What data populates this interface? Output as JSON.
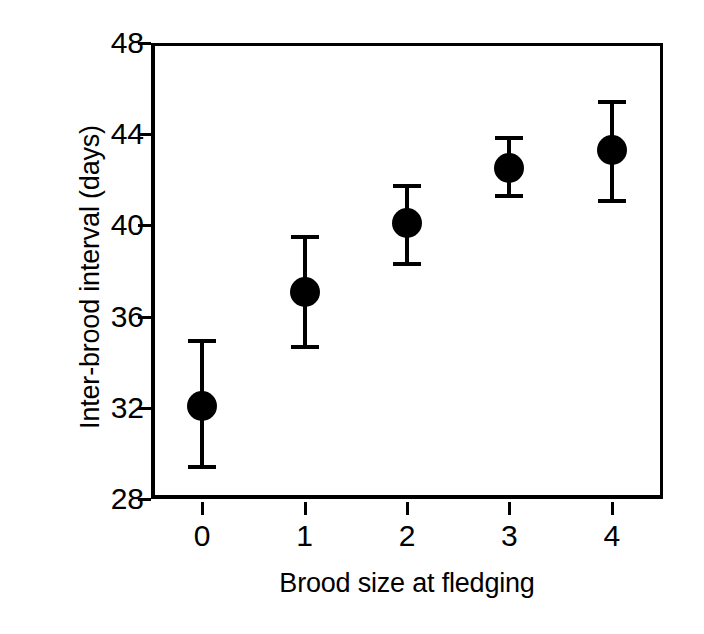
{
  "chart_data": {
    "type": "scatter",
    "title": "",
    "xlabel": "Brood size at fledging",
    "ylabel": "Inter-brood interval (days)",
    "xlim": [
      -0.5,
      4.5
    ],
    "ylim": [
      28,
      48
    ],
    "grid": false,
    "legend": false,
    "error_bar_style": "mean with capped error bars",
    "marker_style": "filled black circle",
    "xticks": [
      0,
      1,
      2,
      3,
      4
    ],
    "xtick_labels": [
      "0",
      "1",
      "2",
      "3",
      "4"
    ],
    "yticks": [
      28,
      32,
      36,
      40,
      44,
      48
    ],
    "ytick_labels": [
      "28",
      "32",
      "36",
      "40",
      "44",
      "48"
    ],
    "x": [
      0,
      1,
      2,
      3,
      4
    ],
    "values": [
      32.1,
      37.1,
      40.1,
      42.5,
      43.3
    ],
    "error_low": [
      29.3,
      34.6,
      38.2,
      41.2,
      41.0
    ],
    "error_high": [
      35.0,
      39.6,
      41.8,
      43.9,
      45.5
    ],
    "points": [
      {
        "x": "0",
        "y": 32.1,
        "low": 29.3,
        "high": 35.0
      },
      {
        "x": "1",
        "y": 37.1,
        "low": 34.6,
        "high": 39.6
      },
      {
        "x": "2",
        "y": 40.1,
        "low": 38.2,
        "high": 41.8
      },
      {
        "x": "3",
        "y": 42.5,
        "low": 41.2,
        "high": 43.9
      },
      {
        "x": "4",
        "y": 43.3,
        "low": 41.0,
        "high": 45.5
      }
    ],
    "colors": {
      "marker": "#000000",
      "error_bar": "#000000",
      "axis": "#000000",
      "background": "#ffffff"
    }
  }
}
